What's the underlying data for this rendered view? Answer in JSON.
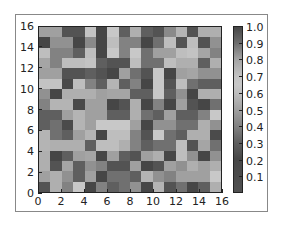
{
  "chart_data": {
    "type": "heatmap",
    "title": "",
    "xlabel": "",
    "ylabel": "",
    "xlim": [
      0,
      16
    ],
    "ylim": [
      0,
      16
    ],
    "grid": false,
    "x_ticks": [
      "0",
      "2",
      "4",
      "6",
      "8",
      "10",
      "12",
      "14",
      "16"
    ],
    "y_ticks": [
      "0",
      "2",
      "4",
      "6",
      "8",
      "10",
      "12",
      "14",
      "16"
    ],
    "colorbar": {
      "position": "right",
      "range": [
        0.0,
        1.0
      ],
      "ticks": [
        "0.1",
        "0.2",
        "0.3",
        "0.4",
        "0.5",
        "0.6",
        "0.7",
        "0.8",
        "0.9",
        "1.0"
      ],
      "colormap": "grayscale (dark at both ends, lightest near 0.65)"
    },
    "rows_top_to_bottom": [
      [
        0.5,
        0.5,
        0.25,
        0.25,
        0.7,
        0.2,
        0.65,
        0.3,
        0.55,
        0.3,
        0.25,
        0.85,
        0.75,
        0.25,
        0.55,
        0.55
      ],
      [
        0.2,
        0.45,
        0.45,
        0.2,
        0.85,
        0.2,
        0.6,
        0.4,
        0.4,
        0.2,
        0.35,
        0.6,
        0.25,
        0.6,
        0.25,
        0.45
      ],
      [
        0.6,
        0.4,
        0.4,
        0.3,
        0.6,
        0.2,
        0.65,
        0.4,
        0.65,
        0.35,
        0.5,
        0.5,
        0.6,
        0.7,
        0.8,
        0.4
      ],
      [
        0.8,
        0.4,
        0.6,
        0.6,
        0.7,
        0.3,
        0.25,
        0.25,
        0.6,
        0.35,
        0.35,
        0.6,
        0.55,
        0.55,
        0.3,
        0.55
      ],
      [
        0.5,
        0.5,
        0.25,
        0.25,
        0.3,
        0.25,
        0.2,
        0.5,
        0.35,
        0.25,
        0.65,
        0.2,
        0.5,
        0.8,
        0.45,
        0.45
      ],
      [
        0.7,
        0.7,
        0.15,
        0.6,
        0.4,
        0.3,
        0.75,
        0.3,
        0.4,
        0.2,
        0.65,
        0.25,
        0.6,
        0.35,
        0.3,
        0.3
      ],
      [
        0.45,
        0.2,
        0.55,
        0.55,
        0.55,
        0.5,
        0.8,
        0.8,
        0.3,
        0.3,
        0.65,
        0.3,
        0.45,
        0.2,
        0.55,
        0.55
      ],
      [
        0.4,
        0.75,
        0.75,
        0.15,
        0.5,
        0.5,
        0.2,
        0.25,
        0.55,
        0.2,
        0.4,
        0.2,
        0.5,
        0.25,
        0.2,
        0.35
      ],
      [
        0.3,
        0.3,
        0.5,
        0.75,
        0.5,
        0.5,
        0.3,
        0.3,
        0.55,
        0.35,
        0.3,
        0.5,
        0.3,
        0.3,
        0.4,
        0.65
      ],
      [
        0.3,
        0.35,
        0.1,
        0.75,
        0.5,
        0.65,
        0.65,
        0.65,
        0.5,
        0.2,
        0.45,
        0.45,
        0.35,
        0.35,
        0.55,
        0.45
      ],
      [
        0.75,
        0.35,
        0.3,
        0.5,
        0.75,
        0.2,
        0.6,
        0.6,
        0.4,
        0.25,
        0.65,
        0.35,
        0.3,
        0.55,
        0.55,
        0.1
      ],
      [
        0.75,
        0.55,
        0.55,
        0.55,
        0.3,
        0.6,
        0.6,
        0.55,
        0.4,
        0.3,
        0.35,
        0.35,
        0.6,
        0.25,
        0.8,
        0.35
      ],
      [
        0.55,
        0.2,
        0.3,
        0.5,
        0.8,
        0.2,
        0.5,
        0.3,
        0.25,
        0.5,
        0.55,
        0.2,
        0.6,
        0.45,
        0.2,
        0.45
      ],
      [
        0.55,
        0.25,
        0.8,
        0.3,
        0.45,
        0.4,
        0.25,
        0.25,
        0.5,
        0.2,
        0.25,
        0.5,
        0.45,
        0.55,
        0.5,
        0.55
      ],
      [
        0.5,
        0.55,
        0.45,
        0.3,
        0.5,
        0.2,
        0.35,
        0.35,
        0.3,
        0.75,
        0.45,
        0.4,
        0.5,
        0.5,
        0.5,
        0.65
      ],
      [
        0.25,
        0.55,
        0.4,
        0.65,
        0.2,
        0.4,
        0.3,
        0.35,
        0.45,
        0.2,
        0.75,
        0.25,
        0.35,
        0.2,
        0.3,
        0.55
      ]
    ]
  }
}
